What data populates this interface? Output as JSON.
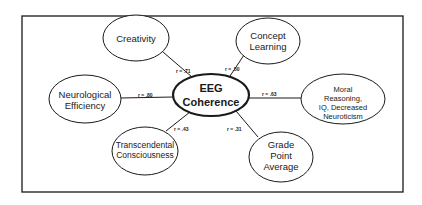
{
  "diagram": {
    "center": {
      "line1": "EEG",
      "line2": "Coherence"
    },
    "nodes": [
      {
        "id": "creativity",
        "lines": [
          "Creativity"
        ],
        "r": "r = .71"
      },
      {
        "id": "concept-learning",
        "lines": [
          "Concept",
          "Learning"
        ],
        "r": "r = .50"
      },
      {
        "id": "neurological-efficiency",
        "lines": [
          "Neurological",
          "Efficiency"
        ],
        "r": "r = .80"
      },
      {
        "id": "moral-reasoning",
        "lines": [
          "Moral",
          "Reasoning,",
          "IQ, Decreased",
          "Neuroticism"
        ],
        "r": "r = .63"
      },
      {
        "id": "transcendental-consciousness",
        "lines": [
          "Transcendental",
          "Consciousness"
        ],
        "r": "r = .43"
      },
      {
        "id": "grade-point-average",
        "lines": [
          "Grade",
          "Point",
          "Average"
        ],
        "r": "r = .31"
      }
    ]
  },
  "colors": {
    "stroke": "#1a1a1a",
    "background": "#ffffff"
  }
}
